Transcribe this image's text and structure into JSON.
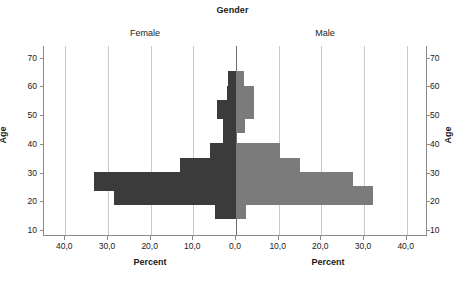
{
  "chart_data": {
    "type": "bar",
    "title": "Gender",
    "subtype": "population-pyramid",
    "xlabel": "Percent",
    "ylabel": "Age",
    "xlim": [
      -45,
      45
    ],
    "ylim": [
      8,
      74
    ],
    "grid": true,
    "legend_position": "panel-headers",
    "panels": [
      "Female",
      "Male"
    ],
    "categories": [
      17,
      22,
      27,
      32,
      37,
      42,
      47,
      52,
      57,
      62
    ],
    "xticks_left": [
      "40,0",
      "30,0",
      "20,0",
      "10,0",
      "0,0"
    ],
    "xticks_right": [
      "0,0",
      "10,0",
      "20,0",
      "30,0",
      "40,0"
    ],
    "xtick_values_left": [
      40.0,
      30.0,
      20.0,
      10.0,
      0.0
    ],
    "xtick_values_right": [
      0.0,
      10.0,
      20.0,
      30.0,
      40.0
    ],
    "yticks": [
      "10",
      "20",
      "30",
      "40",
      "50",
      "60",
      "70"
    ],
    "ytick_values": [
      10,
      20,
      30,
      40,
      50,
      60,
      70
    ],
    "series": [
      {
        "name": "Female",
        "side": "left",
        "color": "#3b3b3b",
        "values": [
          5.0,
          28.6,
          33.3,
          13.2,
          6.0,
          3.0,
          3.0,
          4.5,
          2.2,
          1.9
        ]
      },
      {
        "name": "Male",
        "side": "right",
        "color": "#7b7b7b",
        "values": [
          2.3,
          32.1,
          27.5,
          15.0,
          10.4,
          0.0,
          2.2,
          4.3,
          4.3,
          1.9
        ]
      }
    ]
  },
  "chart": {
    "title": "Gender",
    "panel_female": "Female",
    "panel_male": "Male",
    "xlabel_left": "Percent",
    "xlabel_right": "Percent",
    "ylabel_left": "Age",
    "ylabel_right": "Age"
  }
}
